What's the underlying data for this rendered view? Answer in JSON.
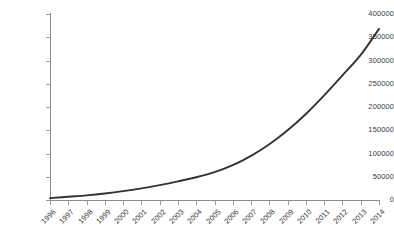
{
  "chart_data": {
    "type": "line",
    "title": "",
    "subtitle": "",
    "xlabel": "",
    "ylabel": "",
    "categories": [
      "1996",
      "1997",
      "1998",
      "1999",
      "2000",
      "2001",
      "2002",
      "2003",
      "2004",
      "2005",
      "2006",
      "2007",
      "2008",
      "2009",
      "2010",
      "2011",
      "2012",
      "2013",
      "2014"
    ],
    "values": [
      4000,
      7000,
      10000,
      14000,
      19000,
      25000,
      32000,
      40000,
      49000,
      60000,
      75000,
      95000,
      120000,
      150000,
      185000,
      225000,
      268000,
      312000,
      368000
    ],
    "series": [
      {
        "name": "series-1",
        "values": [
          4000,
          7000,
          10000,
          14000,
          19000,
          25000,
          32000,
          40000,
          49000,
          60000,
          75000,
          95000,
          120000,
          150000,
          185000,
          225000,
          268000,
          312000,
          368000
        ]
      }
    ],
    "ylim": [
      0,
      400000
    ],
    "ytick_labels": [
      "400000",
      "350000",
      "300000",
      "250000",
      "200000",
      "150000",
      "100000",
      "50000",
      "0"
    ],
    "ytick_values": [
      400000,
      350000,
      300000,
      250000,
      200000,
      150000,
      100000,
      50000,
      0
    ],
    "ytick_step": 50000,
    "grid": false,
    "legend": false,
    "legend_position": "none",
    "line_color": "#333333",
    "axis_color": "#8d8d8d",
    "label_color": "#3a3a3a",
    "background_color": "#ffffff",
    "xtick_label_rotation": -45,
    "annotations": []
  }
}
